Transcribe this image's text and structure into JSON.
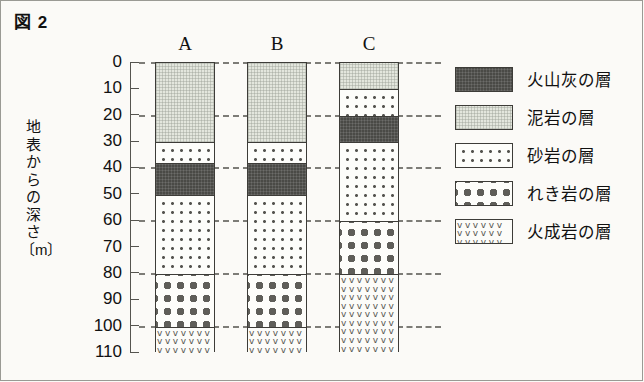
{
  "figure": {
    "title": "図 2"
  },
  "axis": {
    "label_chars": [
      "地",
      "表",
      "か",
      "ら",
      "の",
      "深",
      "さ",
      "〔m〕"
    ],
    "label_text": "地表からの深さ〔m〕",
    "ticks": [
      "0",
      "10",
      "20",
      "30",
      "40",
      "50",
      "60",
      "70",
      "80",
      "90",
      "100",
      "110"
    ]
  },
  "columns": [
    {
      "name": "A"
    },
    {
      "name": "B"
    },
    {
      "name": "C"
    }
  ],
  "legend": [
    {
      "key": "ash",
      "label": "火山灰の層"
    },
    {
      "key": "mud",
      "label": "泥岩の層"
    },
    {
      "key": "sand",
      "label": "砂岩の層"
    },
    {
      "key": "cong",
      "label": "れき岩の層"
    },
    {
      "key": "ign",
      "label": "火成岩の層"
    }
  ],
  "igneous_glyphs": "vvvvvvvvvvvvvvvvvvvvvvvvvvvvvvvvvvvvvvvvvvvvvvvvvvvvvvvvvvvvvvvvvvvvvvvvvvvvvvvvvvvvvvvvvvvvvvvvvvvvvvvvvvvvvvvvvvvvvvvvvvvvvvvvvv",
  "colors": {
    "ash": "#4a4a46",
    "mudstone": "#e3e6dd",
    "sandstone": "#fdfdfa",
    "conglomerate": "#fdfdfa",
    "igneous": "#fcfcf9",
    "outline": "#3d3c38",
    "gridline": "#7d7c77",
    "background": "#fbfaf7"
  },
  "chart_data": {
    "type": "bar",
    "title": "図 2",
    "xlabel": "",
    "ylabel": "地表からの深さ〔m〕",
    "ylim": [
      0,
      110
    ],
    "y_inverted": true,
    "y_ticks": [
      0,
      10,
      20,
      30,
      40,
      50,
      60,
      70,
      80,
      90,
      100,
      110
    ],
    "grid": "dashed horizontal gridlines at 0, 20, 40, 60, 80, 100",
    "legend_position": "right",
    "units": "m",
    "categories": [
      "A",
      "B",
      "C"
    ],
    "rock_types": [
      "火山灰の層",
      "泥岩の層",
      "砂岩の層",
      "れき岩の層",
      "火成岩の層"
    ],
    "columns": [
      {
        "name": "A",
        "layers": [
          {
            "rock": "泥岩の層",
            "key": "mud",
            "top": 0,
            "bottom": 30,
            "thickness": 30
          },
          {
            "rock": "砂岩の層",
            "key": "sand",
            "top": 30,
            "bottom": 38,
            "thickness": 8
          },
          {
            "rock": "火山灰の層",
            "key": "ash",
            "top": 38,
            "bottom": 50,
            "thickness": 12
          },
          {
            "rock": "砂岩の層",
            "key": "sand",
            "top": 50,
            "bottom": 80,
            "thickness": 30
          },
          {
            "rock": "れき岩の層",
            "key": "cong",
            "top": 80,
            "bottom": 100,
            "thickness": 20
          },
          {
            "rock": "火成岩の層",
            "key": "ign",
            "top": 100,
            "bottom": 110,
            "thickness": 10
          }
        ]
      },
      {
        "name": "B",
        "layers": [
          {
            "rock": "泥岩の層",
            "key": "mud",
            "top": 0,
            "bottom": 30,
            "thickness": 30
          },
          {
            "rock": "砂岩の層",
            "key": "sand",
            "top": 30,
            "bottom": 38,
            "thickness": 8
          },
          {
            "rock": "火山灰の層",
            "key": "ash",
            "top": 38,
            "bottom": 50,
            "thickness": 12
          },
          {
            "rock": "砂岩の層",
            "key": "sand",
            "top": 50,
            "bottom": 80,
            "thickness": 30
          },
          {
            "rock": "れき岩の層",
            "key": "cong",
            "top": 80,
            "bottom": 100,
            "thickness": 20
          },
          {
            "rock": "火成岩の層",
            "key": "ign",
            "top": 100,
            "bottom": 110,
            "thickness": 10
          }
        ]
      },
      {
        "name": "C",
        "layers": [
          {
            "rock": "泥岩の層",
            "key": "mud",
            "top": 0,
            "bottom": 10,
            "thickness": 10
          },
          {
            "rock": "砂岩の層",
            "key": "sand",
            "top": 10,
            "bottom": 20,
            "thickness": 10
          },
          {
            "rock": "火山灰の層",
            "key": "ash",
            "top": 20,
            "bottom": 30,
            "thickness": 10
          },
          {
            "rock": "砂岩の層",
            "key": "sand",
            "top": 30,
            "bottom": 60,
            "thickness": 30
          },
          {
            "rock": "れき岩の層",
            "key": "cong",
            "top": 60,
            "bottom": 80,
            "thickness": 20
          },
          {
            "rock": "火成岩の層",
            "key": "ign",
            "top": 80,
            "bottom": 110,
            "thickness": 30
          }
        ]
      }
    ]
  }
}
